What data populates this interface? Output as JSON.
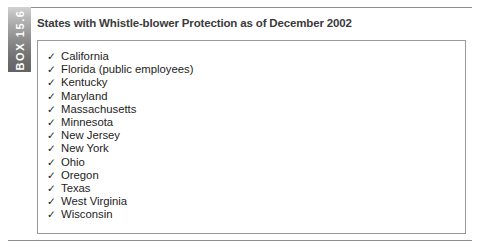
{
  "box": {
    "tab_label": "BOX 15.6",
    "title": "States with Whistle-blower Protection as of December 2002",
    "check_glyph": "✓",
    "colors": {
      "tab_gradient_light": "#d2d2d2",
      "tab_gradient_dark": "#636363",
      "tab_text": "#ffffff",
      "title_text": "#3b3b3b",
      "panel_border": "#9a9a9a",
      "rule_line": "#8e8e8e",
      "list_text": "#1d1d1d",
      "background": "#ffffff"
    },
    "states": [
      "California",
      "Florida (public employees)",
      "Kentucky",
      "Maryland",
      "Massachusetts",
      "Minnesota",
      "New Jersey",
      "New York",
      "Ohio",
      "Oregon",
      "Texas",
      "West Virginia",
      "Wisconsin"
    ]
  }
}
